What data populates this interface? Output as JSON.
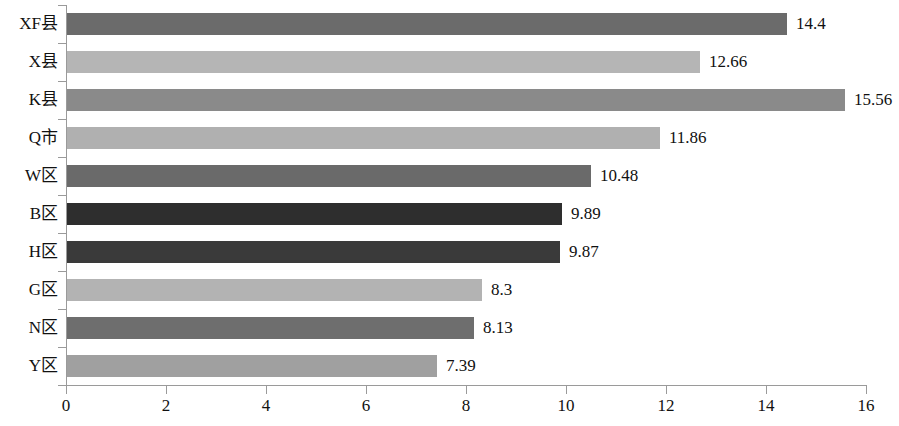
{
  "chart_data": {
    "type": "bar",
    "orientation": "horizontal",
    "title": "",
    "xlabel": "",
    "ylabel": "",
    "xlim": [
      0,
      16
    ],
    "xticks": [
      "0",
      "2",
      "4",
      "6",
      "8",
      "10",
      "12",
      "14",
      "16"
    ],
    "grid": false,
    "legend": false,
    "categories": [
      "XF县",
      "X县",
      "K县",
      "Q市",
      "W区",
      "B区",
      "H区",
      "G区",
      "N区",
      "Y区"
    ],
    "values": [
      14.4,
      12.66,
      15.56,
      11.86,
      10.48,
      9.89,
      9.87,
      8.3,
      8.13,
      7.39
    ],
    "value_labels": [
      "14.4",
      "12.66",
      "15.56",
      "11.86",
      "10.48",
      "9.89",
      "9.87",
      "8.3",
      "8.13",
      "7.39"
    ],
    "bar_colors": [
      "#6b6b6b",
      "#b5b5b5",
      "#8a8a8a",
      "#b0b0b0",
      "#6a6a6a",
      "#2e2e2e",
      "#3a3a3a",
      "#b3b3b3",
      "#6e6e6e",
      "#a0a0a0"
    ],
    "axis_color": "#9a9a9a"
  }
}
